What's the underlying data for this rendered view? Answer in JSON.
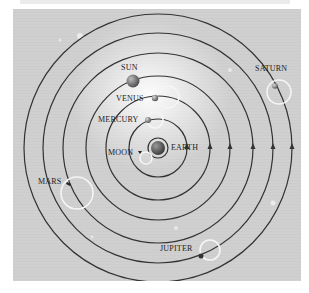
{
  "diagram": {
    "center_body": "EARTH",
    "orbits": [
      {
        "body": "MOON",
        "radius": 10
      },
      {
        "body": "MERCURY",
        "radius": 29
      },
      {
        "body": "VENUS",
        "radius": 52
      },
      {
        "body": "SUN",
        "radius": 72
      },
      {
        "body": "MARS",
        "radius": 95
      },
      {
        "body": "JUPITER",
        "radius": 115
      },
      {
        "body": "SATURN",
        "radius": 134
      }
    ],
    "labels": {
      "sun": "SUN",
      "venus": "VENUS",
      "mercury": "MERCURY",
      "moon": "MOON",
      "earth": "EARTH",
      "mars": "MARS",
      "jupiter": "JUPITER",
      "saturn": "SATURN"
    },
    "colors": {
      "background": "#d0d0d0",
      "orbit_line": "#333333",
      "epicycle": "#f5f5f5",
      "glow": "#ffffff"
    }
  }
}
